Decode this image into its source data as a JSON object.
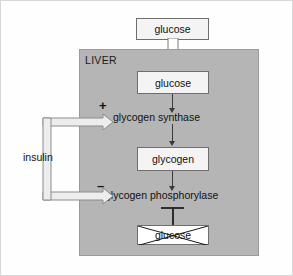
{
  "figure": {
    "compartment": {
      "label": "LIVER",
      "fill_color": "#b5b5b5"
    },
    "nodes": {
      "glucose_blood": "glucose",
      "glucose_liver": "glucose",
      "glycogen": "glycogen",
      "glucose_output": "glucose"
    },
    "enzymes": {
      "synthase": "glycogen synthase",
      "phosphorylase": "glycogen phosphorylase"
    },
    "hormone": {
      "label": "insulin"
    },
    "signs": {
      "activation": "+",
      "inhibition": "–"
    },
    "icons": {
      "uptake_arrow": "block-arrow-down-icon",
      "reaction_arrow": "arrow-down-icon",
      "activation_arrow": "open-arrow-right-icon",
      "inhibition_bar": "inhibition-bar-icon",
      "blocked_marker": "cross-out-x-icon"
    },
    "colors": {
      "panel_fill": "#b5b5b5",
      "panel_stroke": "#9a9a9a",
      "box_fill": "#f4f4f4",
      "box_stroke": "#6e6e6e",
      "arrow_dark": "#3a3a3a",
      "outline_light": "#ededed",
      "outline_stroke": "#8c8c8c",
      "text": "#111111",
      "page_background": "#fefefe"
    }
  }
}
